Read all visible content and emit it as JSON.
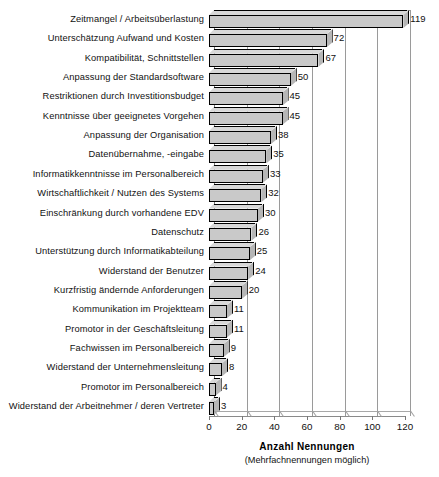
{
  "chart_data": {
    "type": "bar",
    "orientation": "horizontal",
    "title": "",
    "xlabel": "Anzahl  Nennungen",
    "xlabel_note": "(Mehrfachnennungen möglich)",
    "ylabel": "",
    "xlim": [
      0,
      120
    ],
    "xticks": [
      0,
      20,
      40,
      60,
      80,
      100,
      120
    ],
    "grid": true,
    "grid_axis": "x",
    "legend": false,
    "style": "3d-horizontal-bars",
    "bar_color": "#c9c9c9",
    "bar_edge_color": "#000000",
    "categories": [
      "Zeitmangel / Arbeitsüberlastung",
      "Unterschätzung Aufwand und Kosten",
      "Kompatibilität, Schnittstellen",
      "Anpassung der Standardsoftware",
      "Restriktionen durch Investitionsbudget",
      "Kenntnisse über geeignetes Vorgehen",
      "Anpassung der Organisation",
      "Datenübernahme, -eingabe",
      "Informatikkenntnisse im Personalbereich",
      "Wirtschaftlichkeit / Nutzen des Systems",
      "Einschränkung durch vorhandene EDV",
      "Datenschutz",
      "Unterstützung durch Informatikabteilung",
      "Widerstand der Benutzer",
      "Kurzfristig ändernde Anforderungen",
      "Kommunikation im Projektteam",
      "Promotor in der Geschäftsleitung",
      "Fachwissen im Personalbereich",
      "Widerstand der Unternehmensleitung",
      "Promotor im Personalbereich",
      "Widerstand der Arbeitnehmer / deren Vertreter"
    ],
    "values": [
      119,
      72,
      67,
      50,
      45,
      45,
      38,
      35,
      33,
      32,
      30,
      26,
      25,
      24,
      20,
      11,
      11,
      9,
      8,
      4,
      3
    ],
    "value_labels": [
      "119",
      "72",
      "67",
      "50",
      "45",
      "45",
      "38",
      "35",
      "33",
      "32",
      "30",
      "26",
      "25",
      "24",
      "20",
      "11",
      "11",
      "9",
      "8",
      "4",
      "3"
    ],
    "xtick_labels": [
      "0",
      "20",
      "40",
      "60",
      "80",
      "100",
      "120"
    ]
  }
}
